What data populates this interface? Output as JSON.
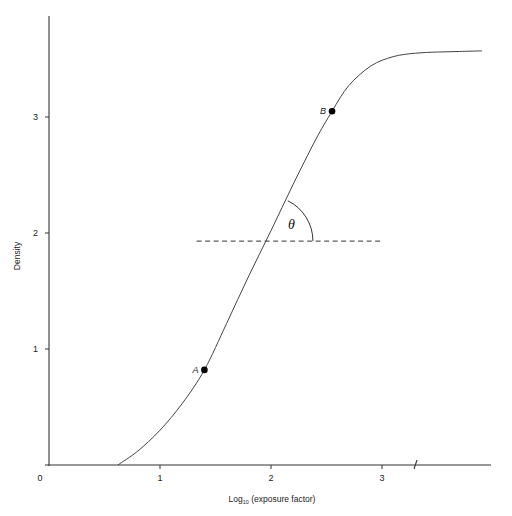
{
  "chart_data": {
    "type": "line",
    "title": "",
    "xlabel": "Log10 (exposure factor)",
    "xlabel_main": "Log",
    "xlabel_sub": "10",
    "xlabel_rest": " (exposure factor)",
    "ylabel": "Density",
    "xlim": [
      0,
      3.9
    ],
    "ylim": [
      0,
      3.8
    ],
    "xticks": [
      0,
      1,
      2,
      3
    ],
    "yticks": [
      0,
      1,
      2,
      3
    ],
    "xtick_labels": [
      "0",
      "1",
      "2",
      "3"
    ],
    "ytick_labels": [
      "1",
      "2",
      "3"
    ],
    "grid": false,
    "legend": null,
    "axis_break_x": 3.3,
    "series": [
      {
        "name": "characteristic curve",
        "x": [
          0.62,
          0.8,
          1.0,
          1.2,
          1.4,
          1.6,
          1.8,
          2.0,
          2.2,
          2.4,
          2.55,
          2.7,
          2.9,
          3.1,
          3.3,
          3.5,
          3.7,
          3.9
        ],
        "y": [
          0.0,
          0.12,
          0.3,
          0.53,
          0.82,
          1.22,
          1.63,
          2.02,
          2.42,
          2.8,
          3.05,
          3.27,
          3.44,
          3.52,
          3.55,
          3.56,
          3.565,
          3.57
        ]
      }
    ],
    "points": [
      {
        "label": "A",
        "x": 1.4,
        "y": 0.82
      },
      {
        "label": "B",
        "x": 2.55,
        "y": 3.05
      }
    ],
    "reference_line": {
      "style": "dashed",
      "y": 1.93,
      "x_start": 1.33,
      "x_end": 3.0
    },
    "annotations": [
      {
        "text": "θ",
        "meaning": "angle between straight-line portion and horizontal (gamma)",
        "x": 2.18,
        "y": 2.05
      }
    ]
  }
}
